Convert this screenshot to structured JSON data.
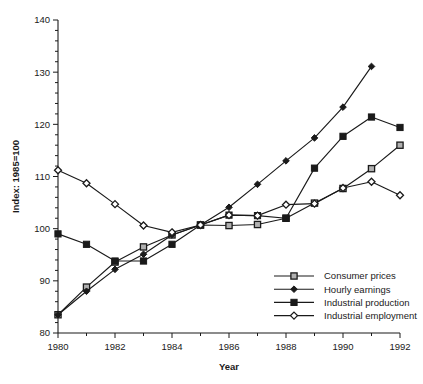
{
  "chart_data": {
    "type": "line",
    "title": "",
    "xlabel": "Year",
    "ylabel": "Index: 1985=100",
    "x": [
      1980,
      1981,
      1982,
      1983,
      1984,
      1985,
      1986,
      1987,
      1988,
      1989,
      1990,
      1991,
      1992
    ],
    "xlim": [
      1980,
      1992
    ],
    "ylim": [
      80,
      140
    ],
    "xticks": [
      1980,
      1982,
      1984,
      1986,
      1988,
      1990,
      1992
    ],
    "xtick_labels": [
      "1980",
      "1982",
      "1984",
      "1986",
      "1988",
      "1990",
      "1992"
    ],
    "xminorticks": [
      1981,
      1983,
      1985,
      1987,
      1989,
      1991
    ],
    "yticks": [
      80,
      90,
      100,
      110,
      120,
      130,
      140
    ],
    "ytick_labels": [
      "80",
      "90",
      "100",
      "110",
      "120",
      "130",
      "140"
    ],
    "yminortick_step": 2,
    "grid": false,
    "legend_position": "lower right",
    "series": [
      {
        "name": "Consumer prices",
        "marker": "open-square",
        "values": [
          83.5,
          88.8,
          93.6,
          96.5,
          98.8,
          100.7,
          100.6,
          100.8,
          102.0,
          104.9,
          107.7,
          111.5,
          116.0
        ]
      },
      {
        "name": "Hourly earnings",
        "marker": "filled-diamond",
        "values": [
          83.5,
          88.0,
          92.2,
          95.1,
          98.8,
          100.7,
          104.1,
          108.5,
          113.0,
          117.4,
          123.3,
          131.1,
          null
        ]
      },
      {
        "name": "Industrial production",
        "marker": "filled-square",
        "values": [
          99.0,
          97.0,
          93.8,
          93.8,
          97.0,
          100.7,
          102.6,
          102.5,
          102.0,
          111.6,
          117.7,
          121.4,
          119.4
        ]
      },
      {
        "name": "Industrial employment",
        "marker": "open-diamond",
        "values": [
          111.2,
          108.7,
          104.7,
          100.6,
          99.3,
          100.7,
          102.6,
          102.5,
          104.6,
          104.8,
          107.8,
          109.0,
          106.4
        ]
      }
    ]
  },
  "legend": {
    "entries": [
      {
        "label": "Consumer prices"
      },
      {
        "label": "Hourly earnings"
      },
      {
        "label": "Industrial production"
      },
      {
        "label": "Industrial employment"
      }
    ]
  }
}
